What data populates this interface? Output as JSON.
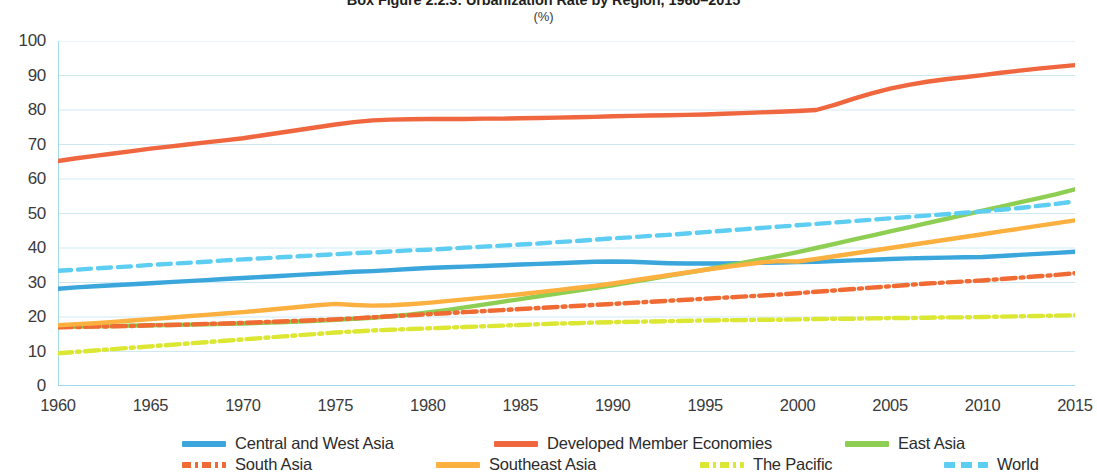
{
  "header": {
    "title": "Box Figure 2.2.3: Urbanization Rate by Region, 1960–2015",
    "unit": "(%)"
  },
  "chart_data": {
    "type": "line",
    "title": "Box Figure 2.2.3: Urbanization Rate by Region, 1960–2015",
    "subtitle": "(%)",
    "xlabel": "",
    "ylabel": "(%)",
    "xlim": [
      1960,
      2015
    ],
    "ylim": [
      0,
      100
    ],
    "ytick_labels": [
      "0",
      "10",
      "20",
      "30",
      "40",
      "50",
      "60",
      "70",
      "80",
      "90",
      "100"
    ],
    "ytick_values": [
      0,
      10,
      20,
      30,
      40,
      50,
      60,
      70,
      80,
      90,
      100
    ],
    "xtick_labels": [
      "1960",
      "1965",
      "1970",
      "1975",
      "1980",
      "1985",
      "1990",
      "1995",
      "2000",
      "2005",
      "2010",
      "2015"
    ],
    "xtick_values": [
      1960,
      1965,
      1970,
      1975,
      1980,
      1985,
      1990,
      1995,
      2000,
      2005,
      2010,
      2015
    ],
    "grid": true,
    "legend_position": "bottom",
    "x": [
      1960,
      1961,
      1962,
      1963,
      1964,
      1965,
      1966,
      1967,
      1968,
      1969,
      1970,
      1971,
      1972,
      1973,
      1974,
      1975,
      1976,
      1977,
      1978,
      1979,
      1980,
      1981,
      1982,
      1983,
      1984,
      1985,
      1986,
      1987,
      1988,
      1989,
      1990,
      1991,
      1992,
      1993,
      1994,
      1995,
      1996,
      1997,
      1998,
      1999,
      2000,
      2001,
      2002,
      2003,
      2004,
      2005,
      2006,
      2007,
      2008,
      2009,
      2010,
      2011,
      2012,
      2013,
      2014,
      2015
    ],
    "series": [
      {
        "name": "Central and West Asia",
        "color": "#3aa6dc",
        "style": "solid",
        "values": [
          28.2,
          28.6,
          28.9,
          29.2,
          29.5,
          29.8,
          30.1,
          30.4,
          30.7,
          31.0,
          31.3,
          31.6,
          31.9,
          32.2,
          32.5,
          32.8,
          33.1,
          33.3,
          33.6,
          33.9,
          34.2,
          34.4,
          34.6,
          34.8,
          35.0,
          35.2,
          35.4,
          35.6,
          35.8,
          36.0,
          36.1,
          36.0,
          35.8,
          35.6,
          35.5,
          35.5,
          35.5,
          35.6,
          35.7,
          35.8,
          35.9,
          36.0,
          36.2,
          36.4,
          36.6,
          36.8,
          37.0,
          37.1,
          37.2,
          37.3,
          37.4,
          37.7,
          38.0,
          38.3,
          38.6,
          38.9
        ]
      },
      {
        "name": "Developed Member Economies",
        "color": "#f0663f",
        "style": "solid",
        "values": [
          65.2,
          66.0,
          66.7,
          67.4,
          68.1,
          68.8,
          69.4,
          70.0,
          70.6,
          71.2,
          71.8,
          72.6,
          73.4,
          74.2,
          75.0,
          75.8,
          76.5,
          77.0,
          77.2,
          77.3,
          77.4,
          77.4,
          77.4,
          77.5,
          77.5,
          77.6,
          77.7,
          77.8,
          77.9,
          78.0,
          78.2,
          78.3,
          78.4,
          78.5,
          78.6,
          78.7,
          78.9,
          79.1,
          79.3,
          79.5,
          79.7,
          80.0,
          81.5,
          83.2,
          84.8,
          86.2,
          87.3,
          88.2,
          88.9,
          89.5,
          90.1,
          90.8,
          91.4,
          92.0,
          92.5,
          93.0
        ]
      },
      {
        "name": "East Asia",
        "color": "#8ece52",
        "style": "solid",
        "values": [
          17.1,
          17.2,
          17.3,
          17.4,
          17.5,
          17.6,
          17.7,
          17.8,
          17.9,
          18.0,
          18.1,
          18.3,
          18.5,
          18.7,
          18.9,
          19.2,
          19.5,
          19.8,
          20.2,
          20.7,
          21.3,
          22.0,
          22.8,
          23.6,
          24.4,
          25.2,
          26.0,
          26.8,
          27.6,
          28.4,
          29.2,
          30.1,
          31.0,
          31.9,
          32.8,
          33.7,
          34.7,
          35.7,
          36.7,
          37.7,
          38.8,
          40.0,
          41.2,
          42.4,
          43.6,
          44.8,
          46.0,
          47.2,
          48.4,
          49.6,
          50.8,
          52.0,
          53.2,
          54.4,
          55.6,
          57.0
        ]
      },
      {
        "name": "South Asia",
        "color": "#ef6b33",
        "style": "dashdot",
        "values": [
          17.0,
          17.1,
          17.2,
          17.3,
          17.4,
          17.6,
          17.7,
          17.8,
          18.0,
          18.1,
          18.3,
          18.5,
          18.7,
          18.9,
          19.1,
          19.3,
          19.6,
          19.9,
          20.2,
          20.5,
          20.8,
          21.1,
          21.4,
          21.7,
          22.0,
          22.3,
          22.6,
          22.9,
          23.2,
          23.5,
          23.8,
          24.1,
          24.4,
          24.7,
          25.0,
          25.3,
          25.6,
          25.9,
          26.2,
          26.5,
          26.9,
          27.3,
          27.7,
          28.1,
          28.5,
          28.9,
          29.3,
          29.7,
          30.0,
          30.3,
          30.6,
          31.0,
          31.4,
          31.8,
          32.2,
          32.7
        ]
      },
      {
        "name": "Southeast Asia",
        "color": "#fbb040",
        "style": "solid",
        "values": [
          17.6,
          17.9,
          18.2,
          18.6,
          19.0,
          19.4,
          19.8,
          20.2,
          20.6,
          21.0,
          21.4,
          21.9,
          22.4,
          22.9,
          23.4,
          23.8,
          23.5,
          23.3,
          23.4,
          23.7,
          24.1,
          24.6,
          25.1,
          25.6,
          26.1,
          26.6,
          27.2,
          27.8,
          28.4,
          29.0,
          29.7,
          30.5,
          31.3,
          32.1,
          32.9,
          33.7,
          34.4,
          35.1,
          35.8,
          36.2,
          36.1,
          36.8,
          37.6,
          38.4,
          39.2,
          40.0,
          40.8,
          41.6,
          42.4,
          43.2,
          44.0,
          44.8,
          45.6,
          46.4,
          47.2,
          48.0
        ]
      },
      {
        "name": "The Pacific",
        "color": "#dbe732",
        "style": "dashdot",
        "values": [
          9.5,
          9.9,
          10.3,
          10.7,
          11.1,
          11.5,
          11.9,
          12.3,
          12.7,
          13.1,
          13.5,
          13.9,
          14.3,
          14.7,
          15.1,
          15.5,
          15.8,
          16.1,
          16.3,
          16.5,
          16.7,
          16.9,
          17.1,
          17.3,
          17.5,
          17.7,
          17.9,
          18.1,
          18.2,
          18.4,
          18.5,
          18.6,
          18.7,
          18.8,
          18.9,
          19.0,
          19.1,
          19.1,
          19.2,
          19.2,
          19.3,
          19.4,
          19.5,
          19.5,
          19.6,
          19.7,
          19.7,
          19.8,
          19.9,
          19.9,
          20.0,
          20.1,
          20.2,
          20.3,
          20.4,
          20.5
        ]
      },
      {
        "name": "World",
        "color": "#5ecdf2",
        "style": "dashed",
        "values": [
          33.4,
          33.7,
          34.1,
          34.4,
          34.7,
          35.1,
          35.4,
          35.7,
          36.0,
          36.4,
          36.7,
          37.0,
          37.3,
          37.6,
          37.9,
          38.2,
          38.5,
          38.7,
          39.0,
          39.3,
          39.5,
          39.8,
          40.1,
          40.4,
          40.7,
          41.0,
          41.3,
          41.7,
          42.0,
          42.4,
          42.8,
          43.1,
          43.5,
          43.8,
          44.2,
          44.6,
          45.0,
          45.4,
          45.8,
          46.2,
          46.6,
          47.0,
          47.4,
          47.8,
          48.2,
          48.6,
          49.0,
          49.4,
          49.8,
          50.2,
          50.6,
          51.1,
          51.6,
          52.2,
          52.8,
          53.5
        ]
      }
    ]
  },
  "legend": {
    "items": [
      {
        "label": "Central and West Asia",
        "color": "#3aa6dc",
        "style": "solid"
      },
      {
        "label": "Developed Member Economies",
        "color": "#f0663f",
        "style": "solid"
      },
      {
        "label": "East Asia",
        "color": "#8ece52",
        "style": "solid"
      },
      {
        "label": "South Asia",
        "color": "#ef6b33",
        "style": "dashdot"
      },
      {
        "label": "Southeast Asia",
        "color": "#fbb040",
        "style": "solid"
      },
      {
        "label": "The Pacific",
        "color": "#dbe732",
        "style": "dashdot"
      },
      {
        "label": "World",
        "color": "#5ecdf2",
        "style": "dashed"
      }
    ]
  },
  "axis_colors": {
    "grid": "#cfe9f3",
    "axis": "#8fd3e8",
    "tick_text": "#3b3b3b"
  }
}
